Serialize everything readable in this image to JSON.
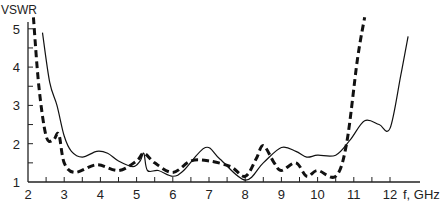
{
  "chart_data": {
    "type": "line",
    "title": "",
    "xlabel": "f, GHz",
    "ylabel": "VSWR",
    "xlim": [
      2,
      12.6
    ],
    "ylim": [
      1,
      5.3
    ],
    "xticks": [
      2,
      3,
      4,
      5,
      6,
      7,
      8,
      9,
      10,
      11,
      12
    ],
    "yticks": [
      1,
      2,
      3,
      4,
      5
    ],
    "grid": false,
    "legend": "none",
    "series": [
      {
        "name": "solid",
        "style": "solid",
        "x": [
          2.4,
          2.6,
          2.8,
          3.0,
          3.2,
          3.5,
          3.9,
          4.2,
          4.5,
          4.9,
          5.1,
          5.2,
          5.3,
          5.6,
          6.0,
          6.3,
          6.9,
          7.3,
          8.0,
          8.5,
          9.0,
          9.4,
          9.7,
          10.0,
          10.5,
          10.9,
          11.3,
          11.7,
          12.0,
          12.3,
          12.5
        ],
        "y": [
          4.9,
          3.6,
          3.0,
          2.2,
          1.8,
          1.65,
          1.8,
          1.75,
          1.55,
          1.4,
          1.55,
          1.75,
          1.3,
          1.3,
          1.15,
          1.3,
          1.9,
          1.6,
          1.05,
          1.5,
          1.9,
          1.8,
          1.65,
          1.7,
          1.7,
          2.1,
          2.6,
          2.5,
          2.4,
          3.8,
          4.8
        ]
      },
      {
        "name": "dashed",
        "style": "dashed",
        "x": [
          2.15,
          2.3,
          2.5,
          2.7,
          2.85,
          3.0,
          3.3,
          3.9,
          4.5,
          5.0,
          5.2,
          5.5,
          6.0,
          6.5,
          7.0,
          7.6,
          8.0,
          8.3,
          8.5,
          8.8,
          9.0,
          9.4,
          9.7,
          10.0,
          10.5,
          10.8,
          11.1,
          11.3
        ],
        "y": [
          5.3,
          3.5,
          2.2,
          2.1,
          2.25,
          1.5,
          1.25,
          1.45,
          1.3,
          1.55,
          1.75,
          1.5,
          1.25,
          1.55,
          1.55,
          1.4,
          1.15,
          1.6,
          1.95,
          1.5,
          1.3,
          1.5,
          1.15,
          1.3,
          1.15,
          2.0,
          4.2,
          5.3
        ]
      }
    ]
  }
}
